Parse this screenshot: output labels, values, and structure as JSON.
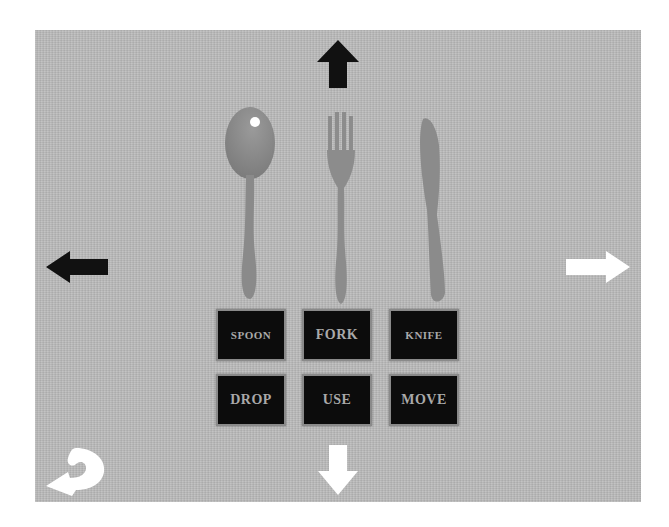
{
  "scene": {
    "background_color": "#bcbcbc",
    "utensils": [
      {
        "name": "spoon"
      },
      {
        "name": "fork"
      },
      {
        "name": "knife"
      }
    ]
  },
  "navigation": {
    "up": {
      "icon": "arrow-up-icon",
      "color": "#111111"
    },
    "down": {
      "icon": "arrow-down-icon",
      "color": "#ffffff"
    },
    "left": {
      "icon": "arrow-left-icon",
      "color": "#111111"
    },
    "right": {
      "icon": "arrow-right-icon",
      "color": "#ffffff"
    },
    "back": {
      "icon": "u-turn-back-icon",
      "color": "#ffffff"
    }
  },
  "item_buttons": [
    {
      "label": "SPOON"
    },
    {
      "label": "FORK"
    },
    {
      "label": "KNIFE"
    }
  ],
  "action_buttons": [
    {
      "label": "DROP"
    },
    {
      "label": "USE"
    },
    {
      "label": "MOVE"
    }
  ],
  "colors": {
    "button_bg": "#0c0c0c",
    "button_text": "#a9a9a9",
    "button_border": "#8a8a8a",
    "utensil": "#8e8e8e"
  }
}
